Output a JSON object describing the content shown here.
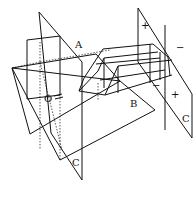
{
  "diagram": {
    "type": "3d-geometry",
    "labels": {
      "A": "A",
      "B": "B",
      "C_left": "C",
      "C_right": "C",
      "O": "O"
    },
    "signs": {
      "top_left": "+",
      "top_right": "−",
      "bottom_left": "−",
      "bottom_right": "+"
    },
    "colors": {
      "line": "#111111",
      "background": "#ffffff"
    }
  }
}
